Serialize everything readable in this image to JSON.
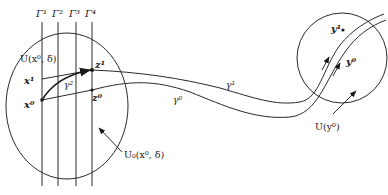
{
  "figure": {
    "type": "mathematical-diagram",
    "colors": {
      "stroke": "#2a2a2a",
      "text": "#1a1a1a",
      "background": "#ffffff"
    }
  },
  "hyperplanes": {
    "labels": [
      "Γ¹",
      "Γ²",
      "Γ³",
      "Γ⁴"
    ]
  },
  "left_region": {
    "label_outer": "U(x⁰, δ)",
    "label_inner": "U₀(x⁰, δ)"
  },
  "right_region": {
    "label": "U(y⁰)"
  },
  "points": {
    "x0": "x⁰",
    "x1": "x¹",
    "z0": "z⁰",
    "z1": "z¹",
    "y0": "y⁰",
    "y1": "y¹"
  },
  "curves": {
    "gamma0": "γ⁰",
    "gamma1": "γ¹",
    "gamma2": "γ²"
  }
}
